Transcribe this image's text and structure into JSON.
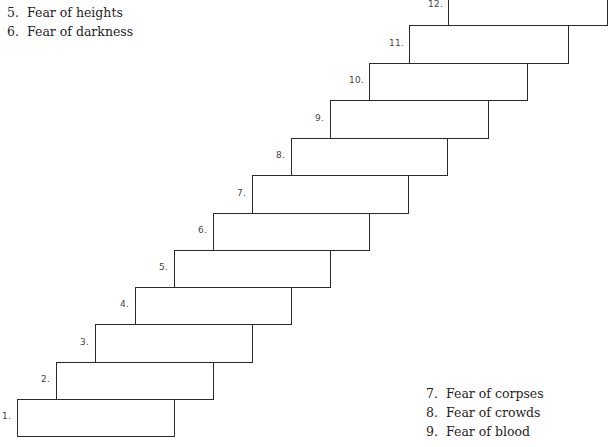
{
  "top_list": [
    {
      "num": "5.",
      "text": "Fear of heights"
    },
    {
      "num": "6.",
      "text": "Fear of darkness"
    }
  ],
  "bottom_list": [
    {
      "num": "7.",
      "text": "Fear of corpses"
    },
    {
      "num": "8.",
      "text": "Fear of crowds"
    },
    {
      "num": "9.",
      "text": "Fear of blood"
    }
  ],
  "ladder": {
    "steps": [
      {
        "label": "1.",
        "x": 17,
        "y": 399,
        "w": 158,
        "h": 38
      },
      {
        "label": "2.",
        "x": 56,
        "y": 362,
        "w": 158,
        "h": 38
      },
      {
        "label": "3.",
        "x": 95,
        "y": 324,
        "w": 158,
        "h": 39
      },
      {
        "label": "4.",
        "x": 135,
        "y": 287,
        "w": 157,
        "h": 38
      },
      {
        "label": "5.",
        "x": 174,
        "y": 250,
        "w": 157,
        "h": 38
      },
      {
        "label": "6.",
        "x": 213,
        "y": 213,
        "w": 157,
        "h": 38
      },
      {
        "label": "7.",
        "x": 252,
        "y": 175,
        "w": 157,
        "h": 39
      },
      {
        "label": "8.",
        "x": 291,
        "y": 138,
        "w": 157,
        "h": 38
      },
      {
        "label": "9.",
        "x": 330,
        "y": 100,
        "w": 159,
        "h": 39
      },
      {
        "label": "10.",
        "x": 369,
        "y": 63,
        "w": 159,
        "h": 38
      },
      {
        "label": "11.",
        "x": 409,
        "y": 25,
        "w": 160,
        "h": 39
      },
      {
        "label": "12.",
        "x": 448,
        "y": -14,
        "w": 160,
        "h": 40
      }
    ]
  }
}
